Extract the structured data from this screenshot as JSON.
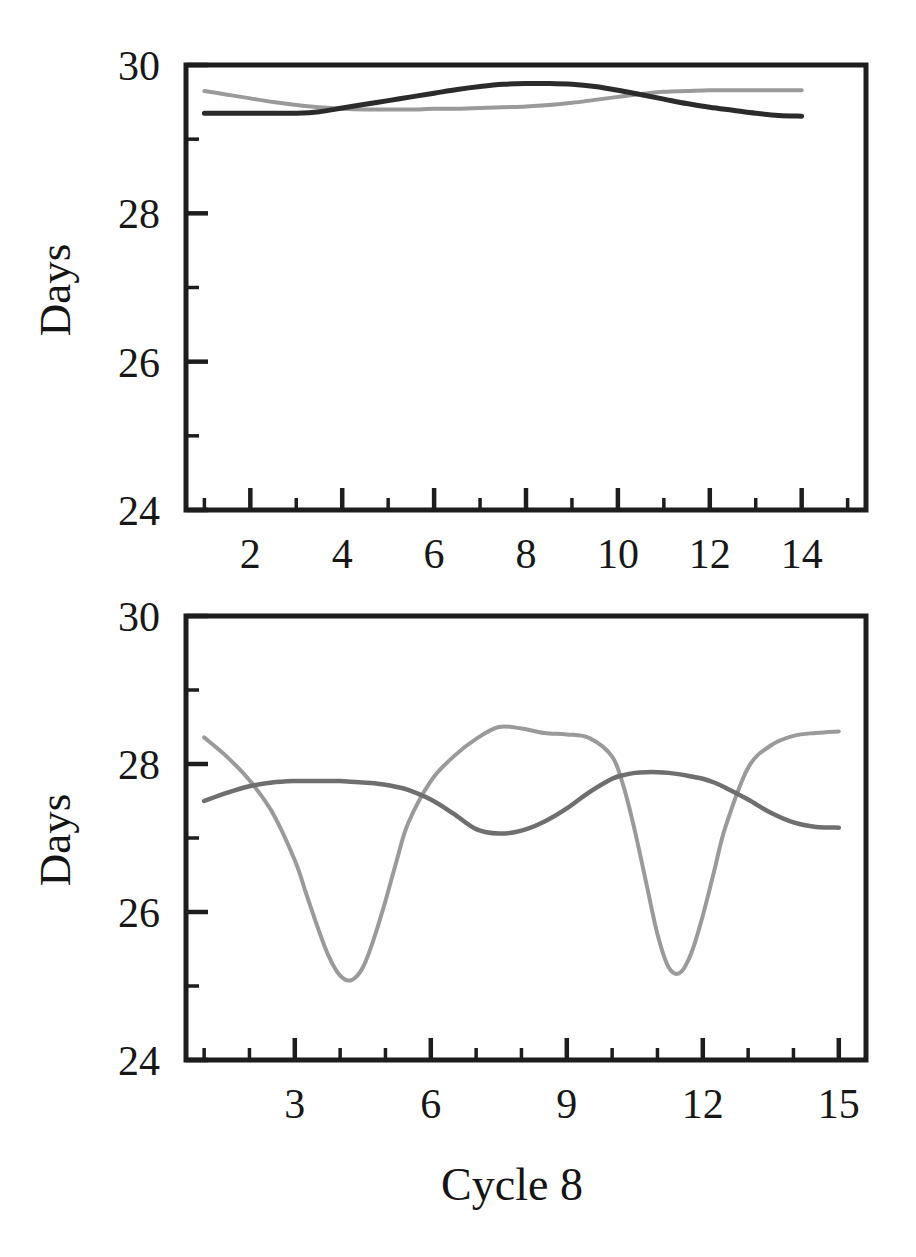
{
  "figure": {
    "title": "Cycle 8",
    "panel_count": 2,
    "background_color": "#ffffff"
  },
  "chart_data": [
    {
      "id": "top-panel",
      "type": "line",
      "title": "",
      "xlabel": "",
      "ylabel": "Days",
      "xlim": [
        0.6,
        15.4
      ],
      "ylim": [
        24,
        30
      ],
      "grid": false,
      "legend": "none",
      "xticks": [
        2,
        4,
        6,
        8,
        10,
        12,
        14
      ],
      "xtick_labels": [
        "2",
        "4",
        "6",
        "8",
        "10",
        "12",
        "14"
      ],
      "xminor_ticks": [
        1,
        3,
        5,
        7,
        9,
        11,
        13,
        15
      ],
      "yticks": [
        24,
        26,
        28,
        30
      ],
      "ytick_labels": [
        "24",
        "26",
        "28",
        "30"
      ],
      "yminor_ticks": [
        25,
        27,
        29
      ],
      "x": [
        1.0,
        1.5,
        2.0,
        2.5,
        3.0,
        3.5,
        4.0,
        4.5,
        5.0,
        5.5,
        6.0,
        6.5,
        7.0,
        7.5,
        8.0,
        8.5,
        9.0,
        9.5,
        10.0,
        10.5,
        11.0,
        11.5,
        12.0,
        12.5,
        13.0,
        13.5,
        14.0
      ],
      "series": [
        {
          "name": "dark-trace",
          "color": "#2b2b2b",
          "values": [
            29.35,
            29.35,
            29.35,
            29.35,
            29.35,
            29.37,
            29.42,
            29.47,
            29.52,
            29.57,
            29.62,
            29.67,
            29.71,
            29.74,
            29.75,
            29.75,
            29.74,
            29.71,
            29.66,
            29.6,
            29.54,
            29.48,
            29.43,
            29.39,
            29.35,
            29.32,
            29.31
          ]
        },
        {
          "name": "light-trace",
          "color": "#9a9a9a",
          "values": [
            29.65,
            29.6,
            29.55,
            29.5,
            29.46,
            29.43,
            29.41,
            29.4,
            29.4,
            29.4,
            29.41,
            29.41,
            29.42,
            29.43,
            29.44,
            29.46,
            29.49,
            29.53,
            29.57,
            29.61,
            29.64,
            29.65,
            29.66,
            29.66,
            29.66,
            29.66,
            29.66
          ]
        }
      ]
    },
    {
      "id": "bottom-panel",
      "type": "line",
      "title": "",
      "xlabel": "Cycle 8",
      "ylabel": "Days",
      "xlim": [
        0.6,
        15.6
      ],
      "ylim": [
        24,
        30
      ],
      "grid": false,
      "legend": "none",
      "xticks": [
        3,
        6,
        9,
        12,
        15
      ],
      "xtick_labels": [
        "3",
        "6",
        "9",
        "12",
        "15"
      ],
      "xminor_ticks": [
        1,
        2,
        4,
        5,
        7,
        8,
        10,
        11,
        13,
        14
      ],
      "yticks": [
        24,
        26,
        28,
        30
      ],
      "ytick_labels": [
        "24",
        "26",
        "28",
        "30"
      ],
      "yminor_ticks": [
        25,
        27,
        29
      ],
      "x": [
        1.0,
        1.5,
        2.0,
        2.5,
        3.0,
        3.25,
        3.5,
        3.75,
        4.0,
        4.25,
        4.5,
        4.75,
        5.0,
        5.25,
        5.5,
        6.0,
        6.5,
        7.0,
        7.5,
        8.0,
        8.5,
        9.0,
        9.5,
        10.0,
        10.25,
        10.5,
        10.75,
        11.0,
        11.25,
        11.5,
        11.75,
        12.0,
        12.25,
        12.5,
        13.0,
        13.5,
        14.0,
        14.5,
        15.0
      ],
      "series": [
        {
          "name": "dark-trace",
          "color": "#555555",
          "values": [
            27.5,
            27.61,
            27.7,
            27.75,
            27.77,
            27.77,
            27.77,
            27.77,
            27.77,
            27.76,
            27.75,
            27.74,
            27.72,
            27.69,
            27.65,
            27.52,
            27.33,
            27.12,
            27.06,
            27.1,
            27.22,
            27.4,
            27.62,
            27.8,
            27.85,
            27.88,
            27.89,
            27.89,
            27.88,
            27.86,
            27.83,
            27.8,
            27.75,
            27.68,
            27.52,
            27.34,
            27.21,
            27.15,
            27.14
          ]
        },
        {
          "name": "light-trace",
          "color": "#8a8a8a",
          "values": [
            28.36,
            28.1,
            27.78,
            27.35,
            26.7,
            26.25,
            25.8,
            25.4,
            25.14,
            25.08,
            25.25,
            25.65,
            26.15,
            26.7,
            27.2,
            27.77,
            28.1,
            28.34,
            28.5,
            28.48,
            28.42,
            28.4,
            28.35,
            28.1,
            27.7,
            27.1,
            26.4,
            25.7,
            25.25,
            25.18,
            25.45,
            25.95,
            26.55,
            27.15,
            27.95,
            28.25,
            28.38,
            28.42,
            28.44
          ]
        }
      ]
    }
  ],
  "labels": {
    "ylabel_top": "Days",
    "ylabel_bottom": "Days",
    "xlabel_bottom": "Cycle 8"
  },
  "colors": {
    "axis": "#1d1d1d",
    "dark_series": "#2b2b2b",
    "light_series": "#9a9a9a",
    "mid_series": "#6f6f6f",
    "background": "#ffffff"
  }
}
